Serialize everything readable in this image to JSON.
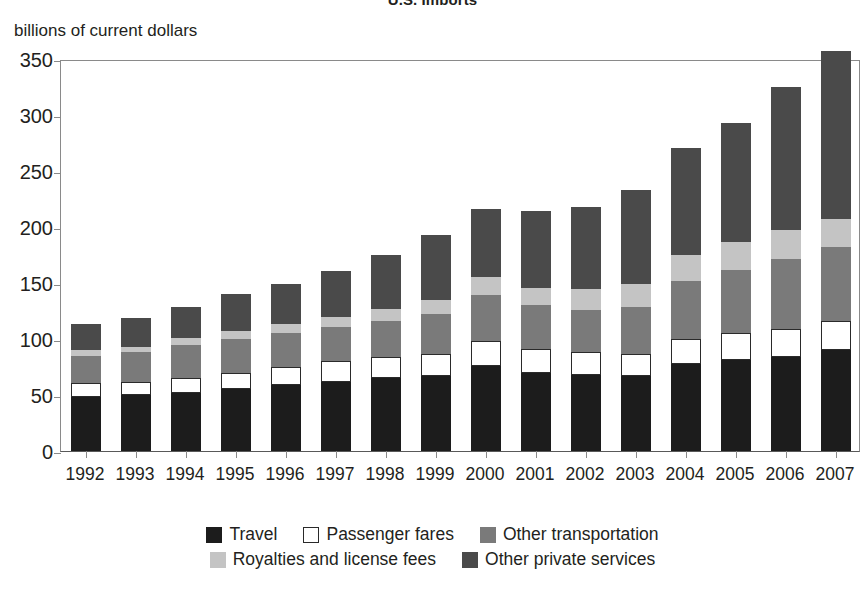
{
  "figure": {
    "title": "U.S. Imports",
    "y_axis_caption": "billions of current dollars"
  },
  "legend": {
    "row1": [
      {
        "label": "Travel",
        "color": "#1c1c1c",
        "swatch": "legend-swatch-travel"
      },
      {
        "label": "Passenger fares",
        "color": "#ffffff",
        "swatch": "legend-swatch-passenger-fares"
      },
      {
        "label": "Other transportation",
        "color": "#7a7a7a",
        "swatch": "legend-swatch-other-transportation"
      }
    ],
    "row2": [
      {
        "label": "Royalties and license fees",
        "color": "#c4c4c4",
        "swatch": "legend-swatch-royalties"
      },
      {
        "label": "Other private services",
        "color": "#4a4a4a",
        "swatch": "legend-swatch-other-private-services"
      }
    ]
  },
  "chart_data": {
    "type": "bar",
    "subtype": "stacked-vertical",
    "title": "U.S. Imports",
    "xlabel": "",
    "ylabel": "billions of current dollars",
    "ylim": [
      0,
      350
    ],
    "ytick_step": 50,
    "yticks": [
      0,
      50,
      100,
      150,
      200,
      250,
      300,
      350
    ],
    "grid": false,
    "legend_position": "bottom",
    "categories": [
      "1992",
      "1993",
      "1994",
      "1995",
      "1996",
      "1997",
      "1998",
      "1999",
      "2000",
      "2001",
      "2002",
      "2003",
      "2004",
      "2005",
      "2006",
      "2007"
    ],
    "series": [
      {
        "name": "Travel",
        "color": "#1c1c1c",
        "values": [
          48,
          50,
          52,
          55,
          59,
          62,
          65,
          67,
          76,
          70,
          68,
          67,
          78,
          81,
          84,
          90
        ]
      },
      {
        "name": "Passenger fares",
        "color": "#ffffff",
        "values": [
          13,
          12,
          13,
          15,
          16,
          18,
          19,
          20,
          22,
          21,
          20,
          20,
          22,
          24,
          25,
          26
        ]
      },
      {
        "name": "Other transportation",
        "color": "#7a7a7a",
        "values": [
          24,
          26,
          30,
          30,
          30,
          31,
          32,
          35,
          41,
          39,
          38,
          42,
          52,
          57,
          62,
          66
        ]
      },
      {
        "name": "Royalties and license fees",
        "color": "#c4c4c4",
        "values": [
          5,
          5,
          6,
          7,
          8,
          9,
          11,
          13,
          16,
          16,
          19,
          20,
          23,
          25,
          26,
          25
        ]
      },
      {
        "name": "Other private services",
        "color": "#4a4a4a",
        "values": [
          23,
          26,
          28,
          33,
          36,
          41,
          48,
          58,
          61,
          68,
          73,
          84,
          96,
          106,
          128,
          150
        ]
      }
    ],
    "totals": [
      113,
      119,
      129,
      140,
      149,
      161,
      175,
      193,
      216,
      214,
      218,
      233,
      271,
      293,
      325,
      357
    ]
  }
}
